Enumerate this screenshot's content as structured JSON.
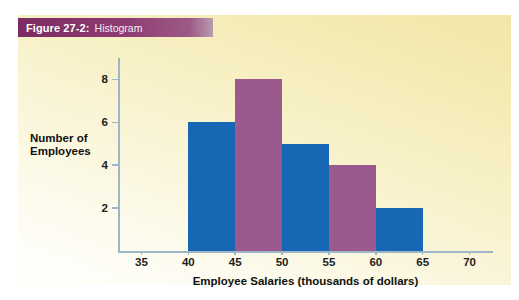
{
  "figure": {
    "label": "Figure 27-2:",
    "title": "Histogram",
    "banner_color": "#8e3c72",
    "panel_gradient_from": "#f2e7a9",
    "panel_gradient_to": "#fffffc"
  },
  "chart_data": {
    "type": "bar",
    "title": "Histogram",
    "xlabel": "Employee Salaries (thousands of dollars)",
    "ylabel": "Number of Employees",
    "ylabel_lines": [
      "Number of",
      "Employees"
    ],
    "categories": [
      "40-45",
      "45-50",
      "50-55",
      "55-60",
      "60-65"
    ],
    "bin_edges": [
      40,
      45,
      50,
      55,
      60,
      65
    ],
    "values": [
      6,
      8,
      5,
      4,
      2
    ],
    "bar_colors": [
      "#1767b4",
      "#9a5a8e",
      "#1767b4",
      "#9a5a8e",
      "#1767b4"
    ],
    "xticks": [
      35,
      40,
      45,
      50,
      55,
      60,
      65,
      70
    ],
    "xtick_labels": [
      "35",
      "40",
      "45",
      "50",
      "55",
      "60",
      "65",
      "70"
    ],
    "yticks": [
      2,
      4,
      6,
      8
    ],
    "ytick_labels": [
      "2",
      "4",
      "6",
      "8"
    ],
    "xlim": [
      32.5,
      72.5
    ],
    "ylim": [
      0,
      9
    ],
    "grid": false,
    "legend": "none",
    "axis_color": "#9db6c8"
  }
}
